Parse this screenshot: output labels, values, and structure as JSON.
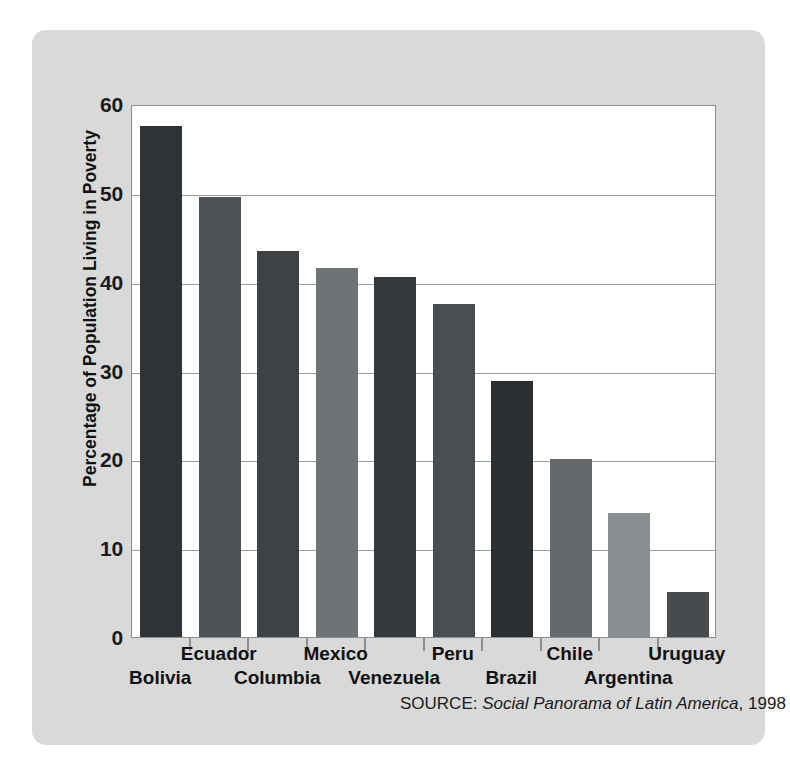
{
  "chart_data": {
    "type": "bar",
    "title": "",
    "xlabel": "",
    "ylabel": "Percentage of Population Living in Poverty",
    "categories": [
      "Bolivia",
      "Ecuador",
      "Columbia",
      "Mexico",
      "Venezuela",
      "Peru",
      "Brazil",
      "Chile",
      "Argentina",
      "Uruguay"
    ],
    "values": [
      57.5,
      49.5,
      43.5,
      41.5,
      40.5,
      37.5,
      28.8,
      20.0,
      14.0,
      5.1
    ],
    "ylim": [
      0,
      60
    ],
    "yticks": [
      0,
      10,
      20,
      30,
      40,
      50,
      60
    ],
    "ytick_labels": [
      "0",
      "10",
      "20",
      "30",
      "40",
      "50",
      "60"
    ],
    "grid": true,
    "legend": "none",
    "bar_colors": [
      "#303335",
      "#4e5254",
      "#3e4244",
      "#6e7376",
      "#35393b",
      "#4a4e50",
      "#2c2f31",
      "#65696c",
      "#8a8e90",
      "#474b4d"
    ],
    "label_rows": [
      1,
      0,
      1,
      0,
      1,
      0,
      1,
      0,
      1,
      0
    ],
    "annotations": [
      {
        "name": "source-note",
        "prefix": "SOURCE: ",
        "title": "Social Panorama of Latin America",
        "suffix": ", 1998"
      }
    ]
  },
  "figure": {
    "background": "#d9d9d9",
    "plot_background": "#ffffff",
    "frame_color": "#8b8f91",
    "grid_color": "#9a9ea0"
  }
}
